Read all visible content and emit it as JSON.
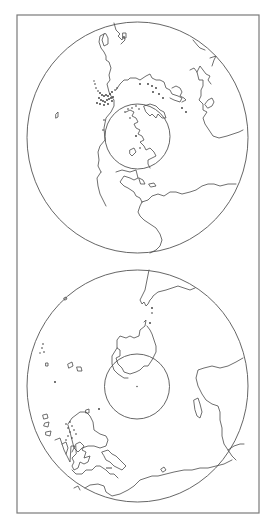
{
  "figure": {
    "frame_color": "#7a7a7a",
    "line_color": "#4a4a4a",
    "background": "#ffffff",
    "maps": [
      {
        "name": "northern-hemisphere",
        "globe": {
          "cx": 137.5,
          "cy": 137.5,
          "rx": 110.5,
          "ry": 115.5
        },
        "inner_circle": {
          "cx": 137.5,
          "cy": 136.5,
          "r": 32.5
        },
        "visible_landmasses": [
          "North America",
          "Greenland",
          "Europe",
          "Africa",
          "South America",
          "Asia (partial)"
        ]
      },
      {
        "name": "southern-hemisphere",
        "globe": {
          "cx": 137.5,
          "cy": 386,
          "rx": 110.5,
          "ry": 116
        },
        "inner_circle": {
          "cx": 137,
          "cy": 386.5,
          "r": 32.5
        },
        "visible_landmasses": [
          "Antarctica",
          "South America tip",
          "Africa",
          "Australia",
          "Southeast Asia islands",
          "New Zealand"
        ]
      }
    ]
  }
}
